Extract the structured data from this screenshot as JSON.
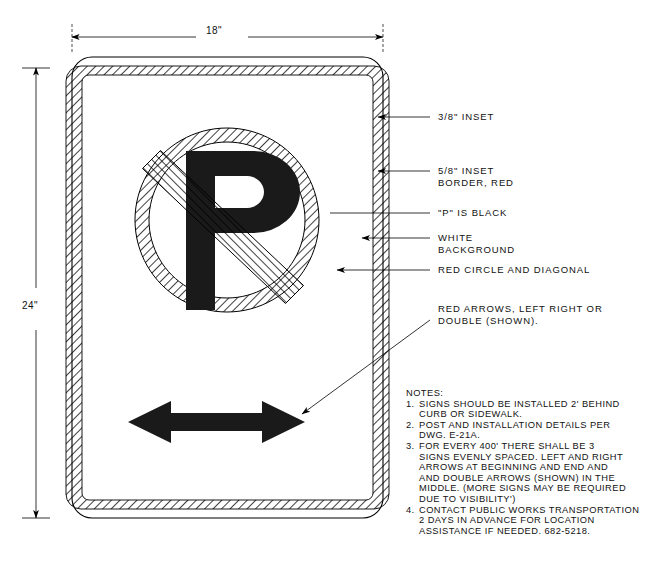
{
  "drawing": {
    "title": "No Parking Sign Fabrication Detail",
    "dimensions": {
      "width_label": "18\"",
      "height_label": "24\""
    },
    "callouts": [
      {
        "id": "inset-38",
        "text": "3/8\" INSET"
      },
      {
        "id": "inset-58-border",
        "line1": "5/8\" INSET",
        "line2": "BORDER, RED"
      },
      {
        "id": "p-black",
        "text": "\"P\" IS BLACK"
      },
      {
        "id": "white-background",
        "line1": "WHITE",
        "line2": "BACKGROUND"
      },
      {
        "id": "red-circle-diagonal",
        "text": "RED CIRCLE AND DIAGONAL"
      },
      {
        "id": "red-arrows",
        "line1": "RED ARROWS, LEFT RIGHT OR",
        "line2": "DOUBLE (SHOWN)."
      }
    ],
    "notes": {
      "heading": "NOTES:",
      "items": [
        {
          "number": "1.",
          "text": "SIGNS SHOULD BE INSTALLED 2' BEHIND\nCURB OR SIDEWALK."
        },
        {
          "number": "2.",
          "text": "POST AND INSTALLATION DETAILS PER\nDWG. E-21A."
        },
        {
          "number": "3.",
          "text": "FOR EVERY 400' THERE SHALL BE 3\nSIGNS EVENLY SPACED. LEFT AND RIGHT\nARROWS AT BEGINNING AND END AND\nAND DOUBLE ARROWS (SHOWN) IN THE\nMIDDLE. (MORE SIGNS MAY BE REQUIRED\nDUE TO VISIBILITY')"
        },
        {
          "number": "4.",
          "text": "CONTACT PUBLIC WORKS TRANSPORTATION\n2 DAYS IN ADVANCE FOR LOCATION\nASSISTANCE IF NEEDED. 682-5218."
        }
      ]
    },
    "sign": {
      "glyph_letter": "P",
      "colors": {
        "line": "#000000",
        "background": "#ffffff",
        "symbol_black": "#1a1a1a",
        "hatch": "#000000"
      }
    }
  }
}
